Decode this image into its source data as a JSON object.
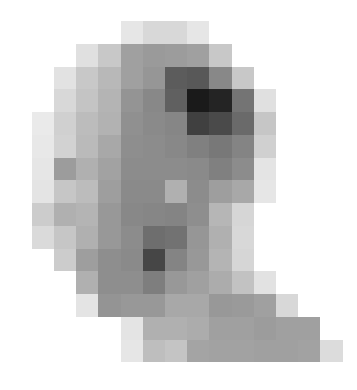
{
  "image": {
    "description": "Pixelated low-resolution grayscale blob shape on white background",
    "width": 357,
    "height": 390,
    "background": "#ffffff",
    "grid": {
      "origin_x": 9.5,
      "origin_y": 21,
      "cell_width": 22.2,
      "cell_height": 22.75,
      "columns": 15,
      "rows": 15
    },
    "rows": [
      {
        "start_col": 5,
        "values": [
          "#e6e6e6",
          "#d8d8d8",
          "#d8d8d8",
          "#e6e6e6"
        ]
      },
      {
        "start_col": 3,
        "values": [
          "#e0e0e0",
          "#c8c8c8",
          "#a0a0a0",
          "#9a9a9a",
          "#9c9c9c",
          "#a0a0a0",
          "#c8c8c8"
        ]
      },
      {
        "start_col": 2,
        "values": [
          "#e2e2e2",
          "#c8c8c8",
          "#b8b8b8",
          "#a0a0a0",
          "#969696",
          "#5c5c5c",
          "#585858",
          "#888888",
          "#c8c8c8"
        ]
      },
      {
        "start_col": 2,
        "values": [
          "#d8d8d8",
          "#c4c4c4",
          "#b4b4b4",
          "#949494",
          "#888888",
          "#606060",
          "#1a1a1a",
          "#242424",
          "#747474",
          "#e0e0e0"
        ]
      },
      {
        "start_col": 1,
        "values": [
          "#eaeaea",
          "#d0d0d0",
          "#bcbcbc",
          "#b2b2b2",
          "#909090",
          "#8a8a8a",
          "#868686",
          "#404040",
          "#4a4a4a",
          "#6a6a6a",
          "#c6c6c6"
        ]
      },
      {
        "start_col": 1,
        "values": [
          "#e8e8e8",
          "#d2d2d2",
          "#bababa",
          "#a8a8a8",
          "#8e8e8e",
          "#8c8c8c",
          "#888888",
          "#808080",
          "#787878",
          "#848484",
          "#d0d0d0"
        ]
      },
      {
        "start_col": 1,
        "values": [
          "#e6e6e6",
          "#9c9c9c",
          "#b0b0b0",
          "#a2a2a2",
          "#8c8c8c",
          "#8c8c8c",
          "#8c8c8c",
          "#8a8a8a",
          "#808080",
          "#8c8c8c",
          "#e4e4e4"
        ]
      },
      {
        "start_col": 1,
        "values": [
          "#e4e4e4",
          "#c6c6c6",
          "#bcbcbc",
          "#9e9e9e",
          "#8a8a8a",
          "#8a8a8a",
          "#b0b0b0",
          "#8c8c8c",
          "#9e9e9e",
          "#a8a8a8",
          "#e6e6e6"
        ]
      },
      {
        "start_col": 1,
        "values": [
          "#cccccc",
          "#b0b0b0",
          "#b4b4b4",
          "#989898",
          "#888888",
          "#868686",
          "#848484",
          "#8e8e8e",
          "#b6b6b6",
          "#d6d6d6"
        ]
      },
      {
        "start_col": 1,
        "values": [
          "#dadada",
          "#c6c6c6",
          "#b0b0b0",
          "#989898",
          "#8c8c8c",
          "#6e6e6e",
          "#727272",
          "#969696",
          "#b0b0b0",
          "#d8d8d8"
        ]
      },
      {
        "start_col": 2,
        "values": [
          "#cccccc",
          "#9e9e9e",
          "#8e8e8e",
          "#8a8a8a",
          "#464646",
          "#848484",
          "#989898",
          "#b4b4b4",
          "#d6d6d6"
        ]
      },
      {
        "start_col": 3,
        "values": [
          "#b0b0b0",
          "#8e8e8e",
          "#8e8e8e",
          "#7e7e7e",
          "#989898",
          "#a0a0a0",
          "#acacac",
          "#c2c2c2",
          "#e2e2e2"
        ]
      },
      {
        "start_col": 3,
        "values": [
          "#e4e4e4",
          "#949494",
          "#989898",
          "#989898",
          "#a8a8a8",
          "#a8a8a8",
          "#989898",
          "#9a9a9a",
          "#a0a0a0",
          "#d8d8d8"
        ]
      },
      {
        "start_col": 5,
        "values": [
          "#e4e4e4",
          "#b0b0b0",
          "#b0b0b0",
          "#acacac",
          "#a0a0a0",
          "#a0a0a0",
          "#9c9c9c",
          "#a0a0a0",
          "#a0a0a0"
        ]
      },
      {
        "start_col": 5,
        "values": [
          "#e6e6e6",
          "#bebebe",
          "#c4c4c4",
          "#a4a4a4",
          "#a2a2a2",
          "#a2a2a2",
          "#a0a0a0",
          "#a0a0a0",
          "#a2a2a2",
          "#dcdcdc"
        ]
      }
    ]
  }
}
